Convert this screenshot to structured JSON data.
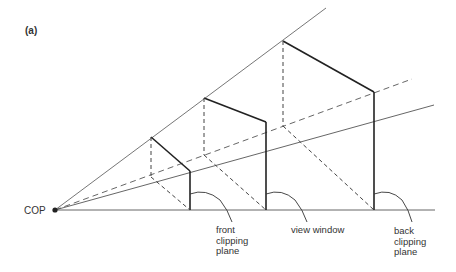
{
  "figure": {
    "panel_label": "(a)",
    "cop_label": "COP",
    "labels": {
      "front": [
        "front",
        "clipping",
        "plane"
      ],
      "view": [
        "view window"
      ],
      "back": [
        "back",
        "clipping",
        "plane"
      ]
    }
  },
  "geometry": {
    "cop": [
      55,
      210
    ],
    "rays": {
      "ground": [
        [
          55,
          210
        ],
        [
          435,
          210
        ]
      ],
      "top": [
        [
          55,
          210
        ],
        [
          326,
          8
        ]
      ],
      "center_dashed": [
        [
          55,
          210
        ],
        [
          412,
          79
        ]
      ],
      "middle": [
        [
          55,
          210
        ],
        [
          434,
          105
        ]
      ]
    },
    "planes": [
      {
        "name": "front clipping plane",
        "front_x": 190,
        "front_top": 171,
        "back_x": 151,
        "back_top": 137,
        "back_bottom": 177
      },
      {
        "name": "view window",
        "front_x": 266,
        "front_top": 122,
        "back_x": 204,
        "back_top": 98,
        "back_bottom": 155
      },
      {
        "name": "back clipping plane",
        "front_x": 374,
        "front_top": 92,
        "back_x": 283,
        "back_top": 41,
        "back_bottom": 126
      }
    ]
  },
  "colors": {
    "thin_line": "#555555",
    "thick_line": "#222222",
    "text": "#333333"
  }
}
